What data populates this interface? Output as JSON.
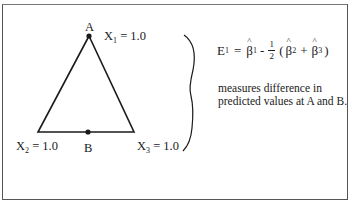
{
  "diagram": {
    "vertices": [
      {
        "id": "A",
        "label": "A",
        "var": "X",
        "sub": "1",
        "value": "= 1.0"
      },
      {
        "id": "X2",
        "var": "X",
        "sub": "2",
        "value": "= 1.0"
      },
      {
        "id": "X3",
        "var": "X",
        "sub": "3",
        "value": "= 1.0"
      },
      {
        "id": "B",
        "label": "B"
      }
    ],
    "equation": {
      "lhs": "E",
      "lhs_sub": "1",
      "eq": "=",
      "beta": "β",
      "b1_sub": "1",
      "minus": "-",
      "frac_num": "1",
      "frac_den": "2",
      "open": "(",
      "b2_sub": "2",
      "plus": "+",
      "b3_sub": "3",
      "close": ")"
    },
    "description": "measures difference in predicted values at A and B.",
    "colors": {
      "line": "#1a1a1a",
      "frame": "#555555",
      "background": "#ffffff"
    }
  }
}
